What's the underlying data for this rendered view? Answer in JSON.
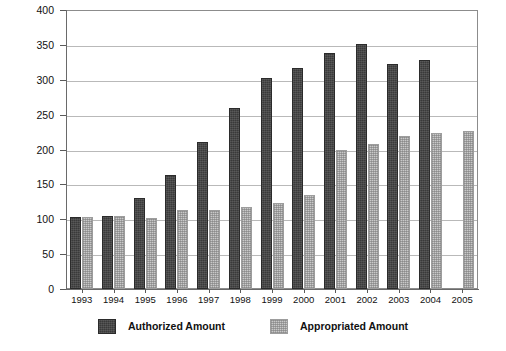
{
  "chart_data": {
    "type": "bar",
    "title": "",
    "subtitle": "",
    "xlabel": "",
    "ylabel": "",
    "ylim": [
      0,
      400
    ],
    "ytick_step": 50,
    "yticks": [
      0,
      50,
      100,
      150,
      200,
      250,
      300,
      350,
      400
    ],
    "ytick_labels": [
      "0",
      "50",
      "100",
      "150",
      "200",
      "250",
      "300",
      "350",
      "400"
    ],
    "grid": true,
    "grid_axis": "y",
    "legend_position": "bottom",
    "categories": [
      "1993",
      "1994",
      "1995",
      "1996",
      "1997",
      "1998",
      "1999",
      "2000",
      "2001",
      "2002",
      "2003",
      "2004",
      "2005"
    ],
    "series": [
      {
        "name": "Authorized Amount",
        "color": "#3a3a3a",
        "pattern": "solid-dark",
        "values": [
          103,
          105,
          131,
          163,
          211,
          259,
          303,
          317,
          339,
          351,
          323,
          329,
          null
        ]
      },
      {
        "name": "Appropriated Amount",
        "color": "#c9c9c9",
        "pattern": "hatched-light",
        "values": [
          103,
          105,
          102,
          113,
          113,
          118,
          123,
          135,
          199,
          208,
          220,
          224,
          226
        ]
      }
    ]
  },
  "legend": {
    "entries": [
      {
        "label": "Authorized Amount",
        "swatch": "authorized"
      },
      {
        "label": "Appropriated Amount",
        "swatch": "appropriated"
      }
    ]
  },
  "bottom_caption": {
    "text": ""
  }
}
